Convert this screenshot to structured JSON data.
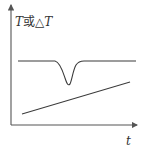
{
  "diagram": {
    "y_axis_label": {
      "var": "T",
      "connector": "或",
      "delta": "△",
      "var2": "T"
    },
    "x_axis_label": "t",
    "colors": {
      "line": "#3a3a3a",
      "axis": "#555555",
      "text": "#333333"
    },
    "curves": [
      {
        "name": "T curve with endothermic dip",
        "description": "horizontal line with a V-shaped dip"
      },
      {
        "name": "rising line",
        "description": "linearly increasing line"
      }
    ]
  }
}
